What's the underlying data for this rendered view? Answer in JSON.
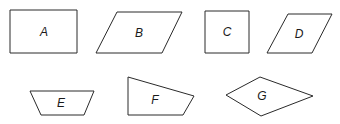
{
  "diagram": {
    "stroke_color": "#2a2a2a",
    "background": "#ffffff",
    "shapes": [
      {
        "label": "A",
        "kind": "rectangle",
        "points": "10,10 77,10 77,53 10,53",
        "label_pos": [
          44,
          36
        ]
      },
      {
        "label": "B",
        "kind": "parallelogram",
        "points": "117,12 182,12 162,53 96,53",
        "label_pos": [
          139,
          37
        ]
      },
      {
        "label": "C",
        "kind": "square",
        "points": "205,11 249,11 249,53 205,53",
        "label_pos": [
          227,
          36
        ]
      },
      {
        "label": "D",
        "kind": "rhombus",
        "points": "288,14 332,14 312,53 267,53",
        "label_pos": [
          299,
          38
        ]
      },
      {
        "label": "E",
        "kind": "trapezoid",
        "points": "30,91 94,91 84,115 41,115",
        "label_pos": [
          61,
          107
        ]
      },
      {
        "label": "F",
        "kind": "quadrilateral",
        "points": "128,77 194,96 183,115 128,115",
        "label_pos": [
          155,
          104
        ]
      },
      {
        "label": "G",
        "kind": "kite",
        "points": "226,95 260,77 313,96 261,116",
        "label_pos": [
          262,
          100
        ]
      }
    ]
  }
}
